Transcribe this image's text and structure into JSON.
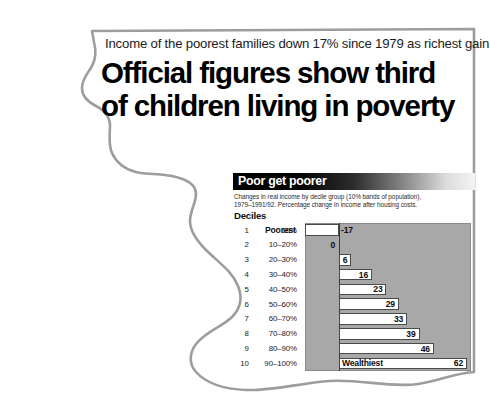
{
  "article": {
    "strapline": "Income of the poorest families down 17% since 1979 as richest gain 62%",
    "headline_line1": "Official figures show third",
    "headline_line2": "of children living in poverty"
  },
  "chart_panel": {
    "title": "Poor get poorer",
    "subtitle_line1": "Changes in real income by decile group (10% bands of population),",
    "subtitle_line2": "1979–1991/92. Percentage change in income after housing costs.",
    "deciles_header": "Deciles",
    "colors": {
      "plot_background": "#a8a8a8",
      "bar_fill": "#ffffff",
      "bar_stroke": "#4a4a4a",
      "title_text": "#ffffff",
      "zero_line": "#3a3a3a"
    }
  },
  "chart_data": {
    "type": "bar",
    "orientation": "horizontal",
    "title": "Poor get poorer",
    "subtitle": "Changes in real income by decile group (10% bands of population), 1979–1991/92. Percentage change in income after housing costs.",
    "xlabel": "",
    "ylabel": "Deciles",
    "grid": false,
    "legend": false,
    "xlim": [
      -17,
      62
    ],
    "zero_reference": 0,
    "categories": [
      "10%",
      "10–20%",
      "20–30%",
      "30–40%",
      "40–50%",
      "50–60%",
      "60–70%",
      "70–80%",
      "80–90%",
      "90–100%"
    ],
    "decile_numbers": [
      "1",
      "2",
      "3",
      "4",
      "5",
      "6",
      "7",
      "8",
      "9",
      "10"
    ],
    "values": [
      -17,
      0,
      6,
      16,
      23,
      29,
      33,
      39,
      46,
      62
    ],
    "value_labels": [
      "-17",
      "0",
      "6",
      "16",
      "23",
      "29",
      "33",
      "39",
      "46",
      "62"
    ],
    "annotations": [
      {
        "index": 0,
        "text": "Poorest"
      },
      {
        "index": 9,
        "text": "Wealthiest"
      }
    ],
    "rows": [
      {
        "num": "1",
        "band": "10%",
        "value": -17,
        "label": "-17",
        "end_label": "Poorest"
      },
      {
        "num": "2",
        "band": "10–20%",
        "value": 0,
        "label": "0",
        "end_label": ""
      },
      {
        "num": "3",
        "band": "20–30%",
        "value": 6,
        "label": "6",
        "end_label": ""
      },
      {
        "num": "4",
        "band": "30–40%",
        "value": 16,
        "label": "16",
        "end_label": ""
      },
      {
        "num": "5",
        "band": "40–50%",
        "value": 23,
        "label": "23",
        "end_label": ""
      },
      {
        "num": "6",
        "band": "50–60%",
        "value": 29,
        "label": "29",
        "end_label": ""
      },
      {
        "num": "7",
        "band": "60–70%",
        "value": 33,
        "label": "33",
        "end_label": ""
      },
      {
        "num": "8",
        "band": "70–80%",
        "value": 39,
        "label": "39",
        "end_label": ""
      },
      {
        "num": "9",
        "band": "80–90%",
        "value": 46,
        "label": "46",
        "end_label": ""
      },
      {
        "num": "10",
        "band": "90–100%",
        "value": 62,
        "label": "62",
        "end_label": "Wealthiest"
      }
    ]
  }
}
